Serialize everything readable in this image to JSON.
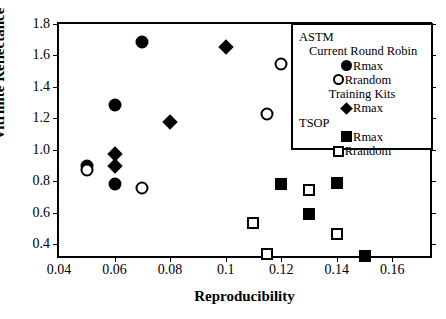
{
  "chart_data": {
    "type": "scatter",
    "title": "",
    "xlabel": "Reproducibility",
    "ylabel": "Vitrinite Reflectance",
    "xlim": [
      0.04,
      0.175
    ],
    "ylim": [
      0.3,
      1.8
    ],
    "xticks": [
      "0.04",
      "0.06",
      "0.08",
      "0.1",
      "0.12",
      "0.14",
      "0.16"
    ],
    "xtick_values": [
      0.04,
      0.06,
      0.08,
      0.1,
      0.12,
      0.14,
      0.16
    ],
    "yticks": [
      "0.4",
      "0.6",
      "0.8",
      "1.0",
      "1.2",
      "1.4",
      "1.6",
      "1.8"
    ],
    "ytick_values": [
      0.4,
      0.6,
      0.8,
      1.0,
      1.2,
      1.4,
      1.6,
      1.8
    ],
    "grid": false,
    "legend_position": "top-right",
    "series": [
      {
        "name": "ASTM Current Round Robin Rmax",
        "marker": "filled-circle",
        "color": "#000000",
        "points": [
          {
            "x": 0.05,
            "y": 0.9
          },
          {
            "x": 0.06,
            "y": 1.285
          },
          {
            "x": 0.06,
            "y": 0.78
          },
          {
            "x": 0.07,
            "y": 1.685
          }
        ]
      },
      {
        "name": "ASTM Current Round Robin Rrandom",
        "marker": "open-circle",
        "color": "#000000",
        "points": [
          {
            "x": 0.05,
            "y": 0.87
          },
          {
            "x": 0.07,
            "y": 0.755
          },
          {
            "x": 0.115,
            "y": 1.225
          },
          {
            "x": 0.12,
            "y": 1.545
          }
        ]
      },
      {
        "name": "ASTM Training Kits Rmax",
        "marker": "filled-diamond",
        "color": "#000000",
        "points": [
          {
            "x": 0.06,
            "y": 0.975
          },
          {
            "x": 0.06,
            "y": 0.9
          },
          {
            "x": 0.08,
            "y": 1.175
          },
          {
            "x": 0.1,
            "y": 1.655
          }
        ]
      },
      {
        "name": "TSOP Rmax",
        "marker": "filled-square",
        "color": "#000000",
        "points": [
          {
            "x": 0.12,
            "y": 0.785
          },
          {
            "x": 0.13,
            "y": 0.59
          },
          {
            "x": 0.14,
            "y": 0.79
          },
          {
            "x": 0.15,
            "y": 0.325
          }
        ]
      },
      {
        "name": "TSOP Rrandom",
        "marker": "open-square",
        "color": "#000000",
        "points": [
          {
            "x": 0.11,
            "y": 0.535
          },
          {
            "x": 0.115,
            "y": 0.335
          },
          {
            "x": 0.13,
            "y": 0.745
          },
          {
            "x": 0.14,
            "y": 0.465
          }
        ]
      }
    ]
  },
  "legend": {
    "group_astm": "ASTM",
    "astm_sub_current": "Current Round Robin",
    "astm_current_rmax": "Rmax",
    "astm_current_rrandom": "Rrandom",
    "astm_sub_training": "Training Kits",
    "astm_training_rmax": "Rmax",
    "group_tsop": "TSOP",
    "tsop_rmax": "Rmax",
    "tsop_rrandom": "Rrandom"
  }
}
